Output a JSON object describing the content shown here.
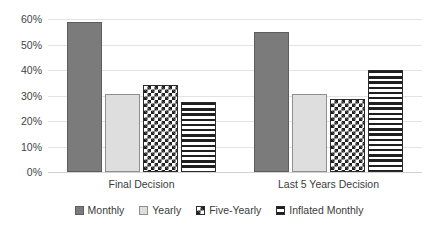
{
  "chart_data": {
    "type": "bar",
    "title": "",
    "subtitle": "",
    "xlabel": "",
    "ylabel": "",
    "categories": [
      "Final Decision",
      "Last 5 Years Decision"
    ],
    "series": [
      {
        "name": "Monthly",
        "values": [
          59,
          55
        ],
        "pattern": "solid-dark-gray",
        "color": "#7b7b7b"
      },
      {
        "name": "Yearly",
        "values": [
          30.5,
          30.5
        ],
        "pattern": "solid-light-gray",
        "color": "#dedede"
      },
      {
        "name": "Five-Yearly",
        "values": [
          34,
          28.5
        ],
        "pattern": "checkerboard",
        "color": "#1f1f1f"
      },
      {
        "name": "Inflated Monthly",
        "values": [
          27.5,
          40
        ],
        "pattern": "horizontal-lines",
        "color": "#1f1f1f"
      }
    ],
    "ylim": [
      0,
      60
    ],
    "yticks": [
      0,
      10,
      20,
      30,
      40,
      50,
      60
    ],
    "ytick_labels": [
      "0%",
      "10%",
      "20%",
      "30%",
      "40%",
      "50%",
      "60%"
    ],
    "grid": "horizontal",
    "legend_position": "bottom",
    "value_format": "percent"
  },
  "axis": {
    "ticks": [
      {
        "label": "60%",
        "value": 60
      },
      {
        "label": "50%",
        "value": 50
      },
      {
        "label": "40%",
        "value": 40
      },
      {
        "label": "30%",
        "value": 30
      },
      {
        "label": "20%",
        "value": 20
      },
      {
        "label": "10%",
        "value": 10
      },
      {
        "label": "0%",
        "value": 0
      }
    ]
  },
  "legend": {
    "items": [
      {
        "label": "Monthly"
      },
      {
        "label": "Yearly"
      },
      {
        "label": "Five-Yearly"
      },
      {
        "label": "Inflated Monthly"
      }
    ]
  }
}
